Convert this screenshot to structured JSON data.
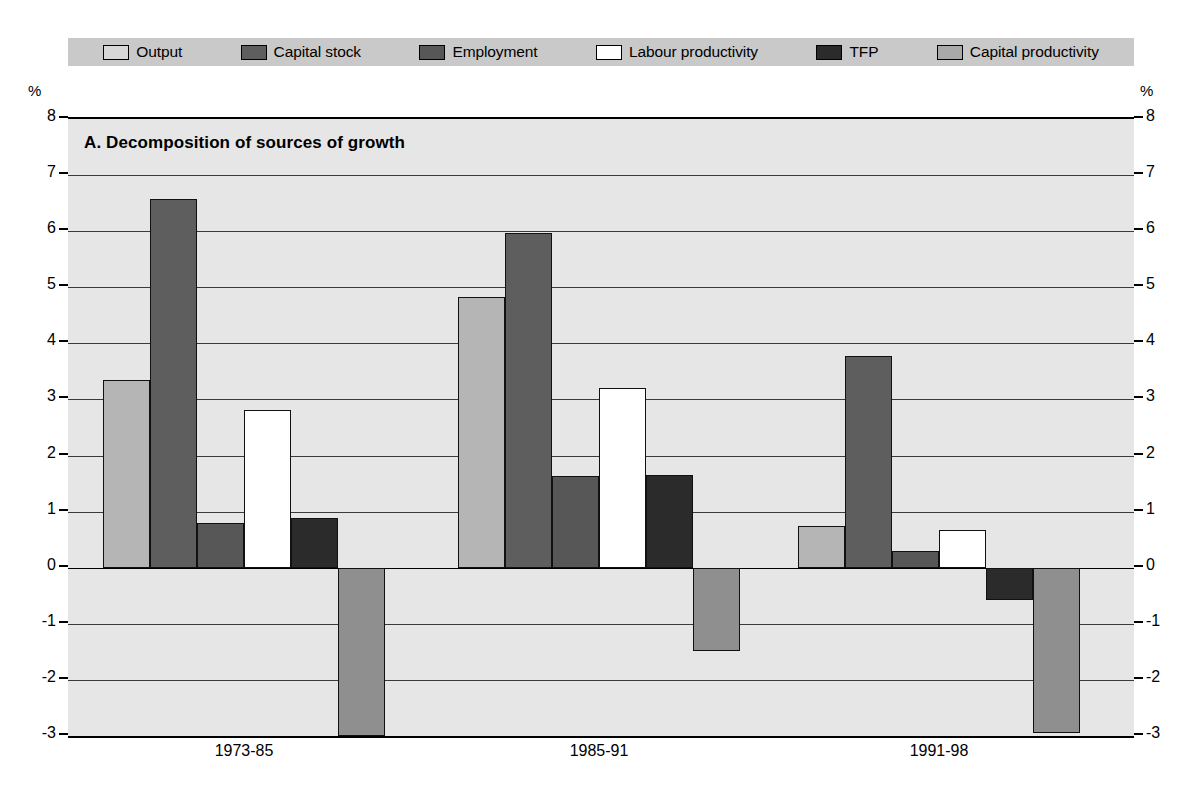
{
  "chart_data": {
    "type": "bar",
    "title": "A. Decomposition of sources of growth",
    "panel_letter": "A.",
    "xlabel": "",
    "ylabel": "%",
    "ylim": [
      -3,
      8
    ],
    "yticks": [
      8,
      7,
      6,
      5,
      4,
      3,
      2,
      1,
      0,
      -1,
      -2,
      -3
    ],
    "ytick_labels": [
      "8",
      "7",
      "6",
      "5",
      "4",
      "3",
      "2",
      "1",
      "0",
      "-1",
      "-2",
      "-3"
    ],
    "grid": true,
    "legend_position": "top",
    "dual_axis": true,
    "axis_unit_label": "%",
    "categories": [
      "1973-85",
      "1985-91",
      "1991-98"
    ],
    "series": [
      {
        "name": "Output",
        "color": "#b5b5b5",
        "values": [
          3.35,
          4.82,
          0.75
        ]
      },
      {
        "name": "Capital stock",
        "color": "#5e5e5e",
        "values": [
          6.58,
          5.97,
          3.78
        ]
      },
      {
        "name": "Employment",
        "color": "#575757",
        "values": [
          0.8,
          1.63,
          0.3
        ]
      },
      {
        "name": "Labour productivity",
        "color": "#ffffff",
        "values": [
          2.82,
          3.2,
          0.67
        ]
      },
      {
        "name": "TFP",
        "color": "#2b2b2b",
        "values": [
          0.88,
          1.66,
          -0.57
        ]
      },
      {
        "name": "Capital productivity",
        "color": "#8f8f8f",
        "values": [
          -3.0,
          -1.48,
          -2.95
        ]
      }
    ]
  },
  "legend": {
    "items": [
      {
        "label": "Output",
        "swatch": "#d7d7d7"
      },
      {
        "label": "Capital stock",
        "swatch": "#5e5e5e"
      },
      {
        "label": "Employment",
        "swatch": "#575757"
      },
      {
        "label": "Labour productivity",
        "swatch": "#ffffff"
      },
      {
        "label": "TFP",
        "swatch": "#2b2b2b"
      },
      {
        "label": "Capital productivity",
        "swatch": "#a9a9a9"
      }
    ]
  },
  "axes": {
    "left_unit": "%",
    "right_unit": "%"
  },
  "colors": {
    "plot_background": "#e6e6e6",
    "legend_background": "#c9c9c9",
    "gridline": "#3a3a3a",
    "axis": "#000000",
    "page_background": "#ffffff"
  }
}
